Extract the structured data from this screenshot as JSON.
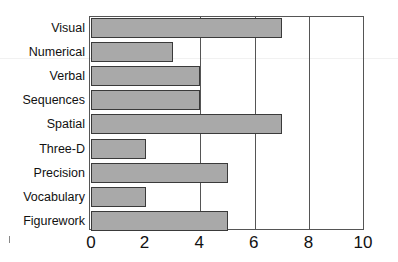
{
  "chart_data": {
    "type": "bar",
    "orientation": "horizontal",
    "title": "",
    "xlabel": "",
    "ylabel": "",
    "categories": [
      "Visual",
      "Numerical",
      "Verbal",
      "Sequences",
      "Spatial",
      "Three-D",
      "Precision",
      "Vocabulary",
      "Figurework"
    ],
    "values": [
      7,
      3,
      4,
      4,
      7,
      2,
      5,
      2,
      5
    ],
    "xlim": [
      0,
      10
    ],
    "xticks": [
      "0",
      "2",
      "4",
      "6",
      "8",
      "10"
    ],
    "grid": "vertical lines at 4, 6, 8",
    "legend": null,
    "bar_color": "#a9a9a9",
    "edge_color": "#3a3a3a"
  }
}
